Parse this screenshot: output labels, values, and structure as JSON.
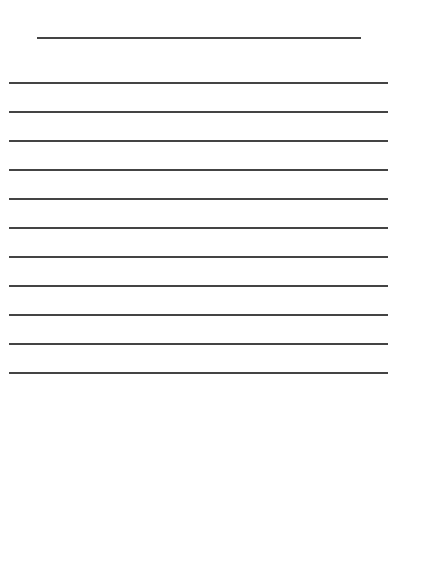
{
  "document": {
    "type": "lined-paper",
    "line_color": "#444444",
    "title_line": {
      "top": 37,
      "left": 37,
      "width": 324
    },
    "body_lines": {
      "count": 11,
      "first_top": 82,
      "spacing": 29,
      "left": 9,
      "width": 379
    }
  }
}
